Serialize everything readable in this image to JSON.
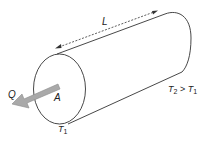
{
  "diagram": {
    "labels": {
      "length": "L",
      "heat_flow": "Q",
      "area": "A",
      "t1_main": "T",
      "t1_sub": "1",
      "t2_main": "T",
      "t2_sub": "2",
      "t2_relation": " > ",
      "t2_rhs_main": "T",
      "t2_rhs_sub": "1"
    },
    "colors": {
      "outline": "#333333",
      "arrow_fill": "#a9a9a9",
      "arrow_stroke": "#8a8a8a",
      "background": "#ffffff"
    }
  }
}
